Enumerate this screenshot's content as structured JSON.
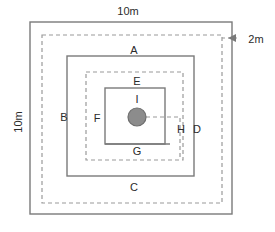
{
  "diagram": {
    "type": "floor-plan-nested-rectangles",
    "canvas": {
      "width": 275,
      "height": 232
    },
    "colors": {
      "solid_wall": "#7a7a7a",
      "dashed_path": "#9a9a9a",
      "marker_fill": "#8c8c8c",
      "marker_stroke": "#6e6e6e",
      "text": "#2b2b2b",
      "background": "#ffffff"
    },
    "dimensions": {
      "top": {
        "text": "10m",
        "x": 128,
        "y": 12
      },
      "left": {
        "text": "10m",
        "x": 19,
        "y": 122,
        "rotation": -90
      },
      "gap": {
        "text": "2m",
        "x": 256,
        "y": 40
      }
    },
    "labels": [
      {
        "id": "A",
        "text": "A",
        "x": 134,
        "y": 51
      },
      {
        "id": "B",
        "text": "B",
        "x": 64,
        "y": 118
      },
      {
        "id": "C",
        "text": "C",
        "x": 134,
        "y": 188
      },
      {
        "id": "D",
        "text": "D",
        "x": 197,
        "y": 130
      },
      {
        "id": "E",
        "text": "E",
        "x": 137,
        "y": 82
      },
      {
        "id": "F",
        "text": "F",
        "x": 97,
        "y": 119
      },
      {
        "id": "G",
        "text": "G",
        "x": 137,
        "y": 152
      },
      {
        "id": "H",
        "text": "H",
        "x": 181,
        "y": 130
      },
      {
        "id": "I",
        "text": "I",
        "x": 137,
        "y": 100
      }
    ],
    "solid_rects": [
      {
        "name": "outer-boundary",
        "x": 30,
        "y": 22,
        "width": 202,
        "height": 192
      },
      {
        "name": "middle-boundary",
        "x": 67,
        "y": 56,
        "width": 127,
        "height": 120
      },
      {
        "name": "inner-boundary",
        "x": 105,
        "y": 88,
        "width": 60,
        "height": 56
      }
    ],
    "dashed_rects": [
      {
        "name": "outer-path",
        "x": 42,
        "y": 35,
        "width": 180,
        "height": 168
      },
      {
        "name": "inner-path",
        "x": 86,
        "y": 72,
        "width": 97,
        "height": 88
      }
    ],
    "marker": {
      "name": "center-marker",
      "cx": 137,
      "cy": 117,
      "r": 9
    },
    "marker_leader": {
      "points": "146,117 180,117 180,160"
    },
    "gap_arrow": {
      "line": "222,38 240,38",
      "tip": "236,34 236,42 228,38"
    },
    "bottom_opening": {
      "line": "105,144 170,144"
    }
  }
}
